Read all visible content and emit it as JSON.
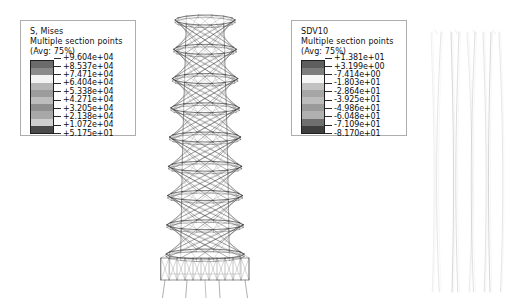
{
  "legends": [
    {
      "name": "s-mises",
      "title": "S, Mises",
      "subtitle": "Multiple section points",
      "avg": "(Avg: 75%)",
      "values": [
        "+9.604e+04",
        "+8.537e+04",
        "+7.471e+04",
        "+6.404e+04",
        "+5.338e+04",
        "+4.271e+04",
        "+3.205e+04",
        "+2.138e+04",
        "+1.072e+04",
        "+5.175e+01"
      ],
      "swatch_colors": [
        "#6b6b6b",
        "#8a8a8a",
        "#f2f2f2",
        "#b5b5b5",
        "#9c9c9c",
        "#bdbdbd",
        "#8f8f8f",
        "#a8a8a8",
        "#cfcfcf",
        "#4a4a4a"
      ]
    },
    {
      "name": "sdv10",
      "title": "SDV10",
      "subtitle": "Multiple section points",
      "avg": "(Avg: 75%)",
      "values": [
        "+1.381e+01",
        "+3.199e+00",
        "-7.414e+00",
        "-1.803e+01",
        "-2.864e+01",
        "-3.925e+01",
        "-4.986e+01",
        "-6.048e+01",
        "-7.109e+01",
        "-8.170e+01"
      ],
      "swatch_colors": [
        "#5e5e5e",
        "#7d7d7d",
        "#f6f6f6",
        "#c2c2c2",
        "#a6a6a6",
        "#bcbcbc",
        "#9a9a9a",
        "#b0b0b0",
        "#6f6f6f",
        "#3f3f3f"
      ]
    }
  ],
  "models": {
    "tower": {
      "label": "hyperboloid-lattice-tower-mesh",
      "stroke": "#3a3a3a",
      "levels": 8
    },
    "deformed": {
      "label": "deformed-member-curves",
      "stroke": "#b9b9b9",
      "curve_count": 9
    }
  },
  "canvas": {
    "background": "#ffffff",
    "width": 511,
    "height": 304
  }
}
